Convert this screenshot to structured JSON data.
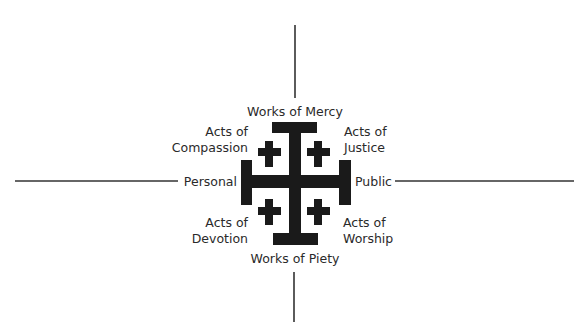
{
  "diagram": {
    "type": "quadrant-cross",
    "colors": {
      "cross": "#1a1a1a",
      "axis_lines": "#333333",
      "text": "#2a2a2a"
    },
    "axes": {
      "top_label": "Works of Mercy",
      "bottom_label": "Works of Piety",
      "left_label": "Personal",
      "right_label": "Public"
    },
    "quadrants": {
      "top_left": {
        "line1": "Acts of",
        "line2": "Compassion"
      },
      "top_right": {
        "line1": "Acts of",
        "line2": "Justice"
      },
      "bottom_left": {
        "line1": "Acts of",
        "line2": "Devotion"
      },
      "bottom_right": {
        "line1": "Acts of",
        "line2": "Worship"
      }
    },
    "center_icon": "jerusalem-cross-icon"
  },
  "caption": {
    "clipped_text": ""
  }
}
